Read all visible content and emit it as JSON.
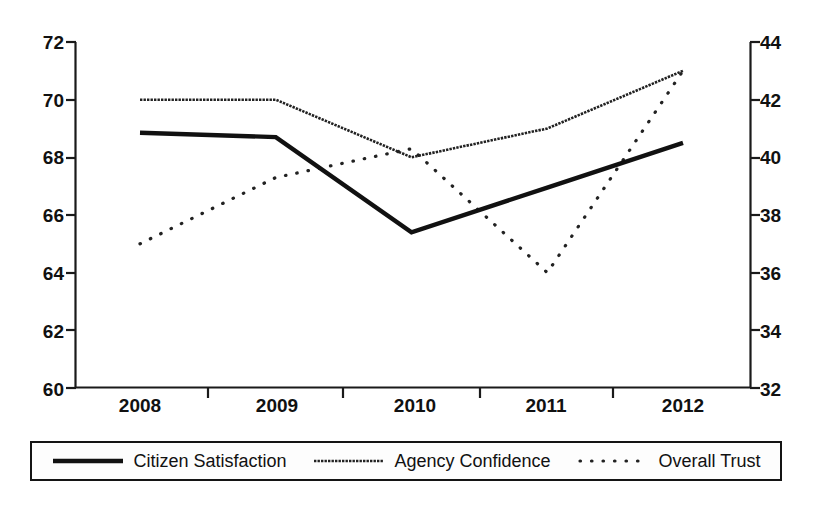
{
  "chart_data": {
    "type": "line",
    "title": "",
    "xlabel": "",
    "ylabel": "",
    "grid": false,
    "categories": [
      "2008",
      "2009",
      "2010",
      "2011",
      "2012"
    ],
    "x_tick_labels": [
      "2008",
      "2009",
      "2010",
      "2011",
      "2012"
    ],
    "left_axis": {
      "label": "",
      "ylim": [
        60,
        72
      ],
      "tick_step": 2,
      "ticks": [
        60,
        62,
        64,
        66,
        68,
        70,
        72
      ],
      "tick_labels": [
        "60",
        "62",
        "64",
        "66",
        "68",
        "70",
        "72"
      ]
    },
    "right_axis": {
      "label": "",
      "ylim": [
        32,
        44
      ],
      "tick_step": 2,
      "ticks": [
        32,
        34,
        36,
        38,
        40,
        42,
        44
      ],
      "tick_labels": [
        "32",
        "34",
        "36",
        "38",
        "40",
        "42",
        "44"
      ]
    },
    "legend_position": "bottom",
    "series": [
      {
        "name": "Citizen Satisfaction",
        "axis": "left",
        "style": "solid-thick",
        "color": "#111111",
        "values": [
          68.85,
          68.7,
          65.4,
          66.95,
          68.5
        ]
      },
      {
        "name": "Agency Confidence",
        "axis": "left",
        "style": "fine-solid",
        "color": "#222222",
        "values": [
          70.0,
          70.0,
          68.0,
          69.0,
          71.0
        ]
      },
      {
        "name": "Overall Trust",
        "axis": "right",
        "style": "dotted",
        "color": "#222222",
        "values": [
          37.0,
          39.3,
          40.3,
          36.0,
          43.0
        ]
      }
    ]
  },
  "legend": {
    "items": [
      {
        "label": "Citizen Satisfaction",
        "style": "solid-thick"
      },
      {
        "label": "Agency Confidence",
        "style": "fine-solid"
      },
      {
        "label": "Overall Trust",
        "style": "dotted"
      }
    ]
  },
  "axis_ticks": {
    "left": [
      "72",
      "70",
      "68",
      "66",
      "64",
      "62",
      "60"
    ],
    "right": [
      "44",
      "42",
      "40",
      "38",
      "36",
      "34",
      "32"
    ],
    "bottom": [
      "2008",
      "2009",
      "2010",
      "2011",
      "2012"
    ]
  }
}
